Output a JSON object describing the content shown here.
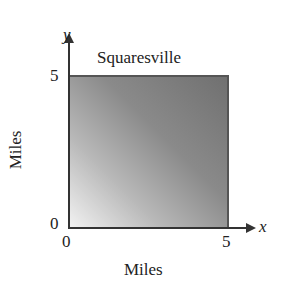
{
  "title": "Squaresville",
  "axes": {
    "x_var": "x",
    "y_var": "y",
    "x_label": "Miles",
    "y_label": "Miles",
    "x_ticks": [
      "0",
      "5"
    ],
    "y_ticks": [
      "0",
      "5"
    ]
  },
  "region": {
    "name": "Squaresville",
    "shape": "square",
    "x_range": [
      0,
      5
    ],
    "y_range": [
      0,
      5
    ],
    "fill": "gradient gray (light at bottom-left, dark at top-right)",
    "colors": {
      "light": "#f2f2f2",
      "dark": "#707070",
      "border": "#555555"
    }
  }
}
